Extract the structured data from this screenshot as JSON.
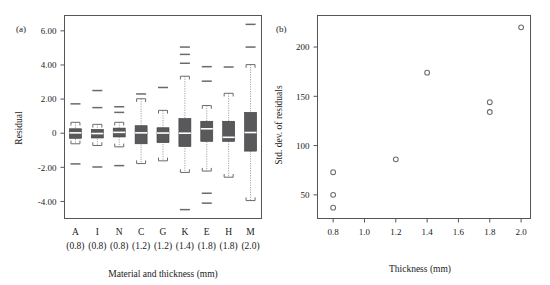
{
  "figure": {
    "panel_a_label": "(a)",
    "panel_b_label": "(b)"
  },
  "chart_data": [
    {
      "type": "box",
      "panel": "(a)",
      "title": "",
      "xlabel": "Material and thickness (mm)",
      "ylabel": "Residual",
      "ylim": [
        -5.0,
        6.9
      ],
      "yticks": [
        6.0,
        4.0,
        2.0,
        0,
        -2.0,
        -4.0
      ],
      "ytick_labels": [
        "6.00",
        "4.00",
        "2.00",
        "0",
        "-2.00",
        "-4.00"
      ],
      "grid": false,
      "legend": "none",
      "categories": [
        "A",
        "I",
        "N",
        "C",
        "G",
        "K",
        "E",
        "H",
        "M"
      ],
      "category_sublabels": [
        "(0.8)",
        "(0.8)",
        "(0.8)",
        "(1.2)",
        "(1.2)",
        "(1.4)",
        "(1.8)",
        "(1.8)",
        "(2.0)"
      ],
      "boxes": [
        {
          "category": "A",
          "thickness": 0.8,
          "whisker_low": -0.62,
          "q1": -0.3,
          "median": 0.02,
          "q3": 0.26,
          "whisker_high": 0.64,
          "outliers": [
            1.72,
            -1.8
          ]
        },
        {
          "category": "I",
          "thickness": 0.8,
          "whisker_low": -0.72,
          "q1": -0.28,
          "median": -0.02,
          "q3": 0.22,
          "whisker_high": 0.52,
          "outliers": [
            2.5,
            1.5,
            -1.98
          ]
        },
        {
          "category": "N",
          "thickness": 0.8,
          "whisker_low": -0.8,
          "q1": -0.22,
          "median": 0.05,
          "q3": 0.3,
          "whisker_high": 0.64,
          "outliers": [
            1.55,
            1.22,
            -1.9
          ]
        },
        {
          "category": "C",
          "thickness": 1.2,
          "whisker_low": -1.78,
          "q1": -0.62,
          "median": 0.02,
          "q3": 0.44,
          "whisker_high": 2.02,
          "outliers": [
            2.3
          ]
        },
        {
          "category": "G",
          "thickness": 1.2,
          "whisker_low": -1.62,
          "q1": -0.55,
          "median": 0.01,
          "q3": 0.32,
          "whisker_high": 1.34,
          "outliers": [
            2.68
          ]
        },
        {
          "category": "K",
          "thickness": 1.4,
          "whisker_low": -2.3,
          "q1": -0.78,
          "median": 0.0,
          "q3": 0.86,
          "whisker_high": 3.34,
          "outliers": [
            5.05,
            4.62,
            4.1,
            -4.48
          ]
        },
        {
          "category": "E",
          "thickness": 1.8,
          "whisker_low": -2.22,
          "q1": -0.48,
          "median": 0.26,
          "q3": 0.7,
          "whisker_high": 1.62,
          "outliers": [
            3.9,
            3.05,
            -3.52,
            -4.1
          ]
        },
        {
          "category": "H",
          "thickness": 1.8,
          "whisker_low": -2.58,
          "q1": -0.48,
          "median": -0.24,
          "q3": 0.7,
          "whisker_high": 2.34,
          "outliers": [
            3.88
          ]
        },
        {
          "category": "M",
          "thickness": 2.0,
          "whisker_low": -3.95,
          "q1": -1.05,
          "median": 0.04,
          "q3": 1.22,
          "whisker_high": 4.02,
          "outliers": [
            6.38,
            5.05
          ]
        }
      ]
    },
    {
      "type": "scatter",
      "panel": "(b)",
      "title": "",
      "xlabel": "Thickness (mm)",
      "ylabel": "Std. dev. of residuals",
      "xlim": [
        0.7,
        2.06
      ],
      "ylim": [
        26,
        232
      ],
      "xticks": [
        0.8,
        1.0,
        1.2,
        1.4,
        1.6,
        1.8,
        2.0
      ],
      "xtick_labels": [
        "0.8",
        "1.0",
        "1.2",
        "1.4",
        "1.6",
        "1.8",
        "2.0"
      ],
      "yticks": [
        50,
        100,
        150,
        200
      ],
      "ytick_labels": [
        "50",
        "100",
        "150",
        "200"
      ],
      "grid": false,
      "legend": "none",
      "points": [
        {
          "x": 0.8,
          "y": 73
        },
        {
          "x": 0.8,
          "y": 50
        },
        {
          "x": 0.8,
          "y": 37
        },
        {
          "x": 1.2,
          "y": 86
        },
        {
          "x": 1.4,
          "y": 174
        },
        {
          "x": 1.8,
          "y": 144
        },
        {
          "x": 1.8,
          "y": 134
        },
        {
          "x": 2.0,
          "y": 220
        }
      ]
    }
  ]
}
